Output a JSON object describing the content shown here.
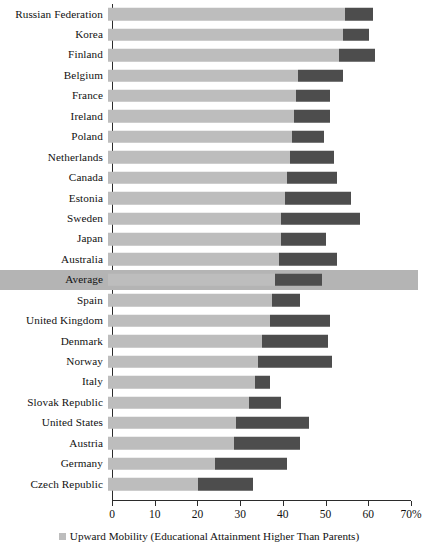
{
  "chart_data": {
    "type": "bar",
    "orientation": "horizontal",
    "stacked": true,
    "title": "",
    "xlabel": "",
    "ylabel": "",
    "xlim": [
      0,
      70
    ],
    "grid": false,
    "axis_suffix": "%",
    "tick_values": [
      0,
      10,
      20,
      30,
      40,
      50,
      60,
      70
    ],
    "tick_labels": [
      "0",
      "10",
      "20",
      "30",
      "40",
      "50",
      "60",
      "70%"
    ],
    "legend": {
      "position": "bottom",
      "entries": [
        {
          "name": "Upward Mobility (Educational Attainment Higher Than Parents)",
          "color": "#bdbdbd"
        }
      ]
    },
    "colors": {
      "light_segment": "#bdbdbd",
      "dark_segment": "#4d4d4d",
      "highlight_row": "#b4b4b4"
    },
    "categories": [
      "Russian Federation",
      "Korea",
      "Finland",
      "Belgium",
      "France",
      "Ireland",
      "Poland",
      "Netherlands",
      "Canada",
      "Estonia",
      "Sweden",
      "Japan",
      "Australia",
      "Average",
      "Spain",
      "United Kingdom",
      "Denmark",
      "Norway",
      "Italy",
      "Slovak Republic",
      "United States",
      "Austria",
      "Germany",
      "Czech Republic"
    ],
    "series": [
      {
        "name": "Upward Mobility (Educational Attainment Higher Than Parents)",
        "color": "#bdbdbd",
        "values": [
          55.5,
          55.0,
          54.0,
          44.5,
          44.0,
          43.5,
          43.0,
          42.5,
          42.0,
          41.5,
          40.5,
          40.5,
          40.0,
          39.0,
          38.5,
          38.0,
          36.0,
          35.0,
          34.5,
          33.0,
          30.0,
          29.5,
          25.0,
          21.0
        ]
      },
      {
        "name": "Downward or Equal Mobility",
        "color": "#4d4d4d",
        "values": [
          6.5,
          6.0,
          8.5,
          10.5,
          8.0,
          8.5,
          7.5,
          10.5,
          11.5,
          15.5,
          18.5,
          10.5,
          13.5,
          11.0,
          6.5,
          14.0,
          15.5,
          17.5,
          3.5,
          7.5,
          17.0,
          15.5,
          17.0,
          13.0
        ]
      }
    ],
    "totals": [
      62.0,
      61.0,
      62.5,
      55.0,
      52.0,
      52.0,
      50.5,
      53.0,
      53.5,
      57.0,
      59.0,
      51.0,
      53.5,
      50.0,
      45.0,
      52.0,
      51.5,
      52.5,
      38.0,
      40.5,
      47.0,
      45.0,
      42.0,
      34.0
    ],
    "highlighted_category": "Average"
  },
  "caption": {
    "legend_text": "Upward Mobility (Educational Attainment Higher Than Parents)"
  }
}
